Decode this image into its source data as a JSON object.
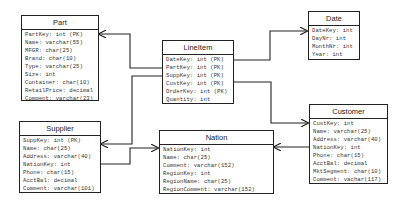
{
  "diagram": {
    "type": "star-schema-er-diagram",
    "entities": {
      "part": {
        "title": "Part",
        "attributes": [
          "PartKey: int (PK)",
          "Name: varchar(55)",
          "MFGR: char(25)",
          "Brand: char(10)",
          "Type: varchar(25)",
          "Size: int",
          "Container: char(10)",
          "RetailPrice: decimal",
          "Comment: varchar(23)"
        ]
      },
      "supplier": {
        "title": "Supplier",
        "attributes": [
          "SuppKey: int (PK)",
          "Name: char(25)",
          "Address: varchar(40)",
          "NationKey: int",
          "Phone: char(15)",
          "AcctBal: decimal",
          "Comment: varchar(101)"
        ]
      },
      "lineitem": {
        "title": "LineItem",
        "attributes": [
          "DateKey: int (PK)",
          "PartKey: int (PK)",
          "SuppKey: int (PK)",
          "CustKey: int (PK)",
          "OrderKey: int (PK)",
          "Quantity: int"
        ]
      },
      "nation": {
        "title": "Nation",
        "attributes": [
          "NationKey: int",
          "Name: char(25)",
          "Comment: varchar(152)",
          "RegionKey: int",
          "RegionName: char(25)",
          "RegionComment: varchar(152)"
        ]
      },
      "date": {
        "title": "Date",
        "attributes": [
          "DateKey: int",
          "DayNr: int",
          "MonthNr: int",
          "Year: int"
        ]
      },
      "customer": {
        "title": "Customer",
        "attributes": [
          "CustKey: int",
          "Name: varchar(25)",
          "Address: varchar(40)",
          "NationKey: int",
          "Phone: char(15)",
          "AcctBal: decimal",
          "MktSegment: char(10)",
          "Comment: vachar(117)"
        ]
      }
    },
    "relationships": [
      {
        "from": "LineItem",
        "to": "Part"
      },
      {
        "from": "LineItem",
        "to": "Supplier"
      },
      {
        "from": "LineItem",
        "to": "Date"
      },
      {
        "from": "LineItem",
        "to": "Customer"
      },
      {
        "from": "Supplier",
        "to": "Nation"
      },
      {
        "from": "Customer",
        "to": "Nation"
      }
    ],
    "colors": {
      "line": "#222222",
      "background": "#ffffff",
      "text": "#333333"
    }
  }
}
